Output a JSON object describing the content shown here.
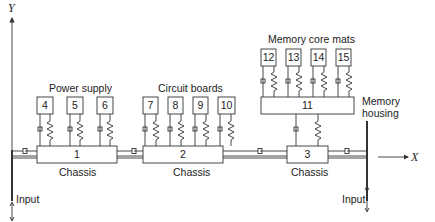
{
  "diagram": {
    "axes": {
      "y_label": "Y",
      "x_label": "X"
    },
    "groups": {
      "power_supply": {
        "label": "Power supply",
        "boxes": [
          "4",
          "5",
          "6"
        ]
      },
      "circuit_boards": {
        "label": "Circuit boards",
        "boxes": [
          "7",
          "8",
          "9",
          "10"
        ]
      },
      "memory_core_mats": {
        "label": "Memory core mats",
        "boxes": [
          "12",
          "13",
          "14",
          "15"
        ]
      }
    },
    "memory_housing": {
      "number": "11",
      "label_line1": "Memory",
      "label_line2": "housing"
    },
    "chassis": [
      {
        "number": "1",
        "label": "Chassis"
      },
      {
        "number": "2",
        "label": "Chassis"
      },
      {
        "number": "3",
        "label": "Chassis"
      }
    ],
    "inputs": {
      "left": "Input",
      "right": "Input"
    },
    "colors": {
      "line": "#333333",
      "text": "#222222",
      "background": "#ffffff"
    }
  }
}
